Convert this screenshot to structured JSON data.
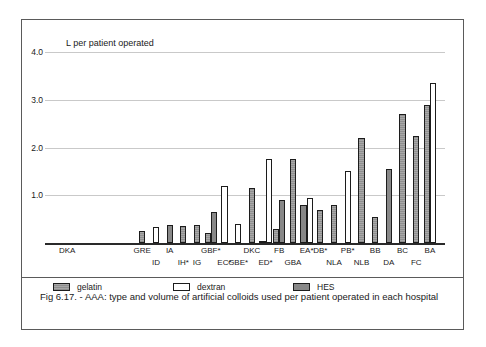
{
  "figure": {
    "caption": "Fig 6.17. - AAA: type and volume of artificial colloids used per patient operated in each hospital",
    "empty_group_label": "DKA"
  },
  "legend": {
    "items": [
      {
        "label": "gelatin",
        "key": "gelatin",
        "color": "#a8a8a8"
      },
      {
        "label": "dextran",
        "key": "dextran",
        "color": "#ffffff"
      },
      {
        "label": "HES",
        "key": "hes",
        "color": "#888888"
      }
    ]
  },
  "chart_data": {
    "type": "bar",
    "title": "",
    "subtitle": "",
    "ylabel": "L  per patient operated",
    "xlabel": "",
    "ylim": [
      0,
      4.0
    ],
    "yticks": [
      "1.0",
      "2.0",
      "3.0",
      "4.0"
    ],
    "ytick_values": [
      1.0,
      2.0,
      3.0,
      4.0
    ],
    "grid": true,
    "legend_position": "below-axis",
    "categories": [
      "GRE",
      "ID",
      "IA",
      "IH*",
      "IG",
      "GBF*",
      "EC*",
      "GBE*",
      "DKC",
      "ED*",
      "FB",
      "GBA",
      "EA*",
      "DB*",
      "NLA",
      "PB*",
      "NLB",
      "BB",
      "DA",
      "BC",
      "FC",
      "BA"
    ],
    "series": [
      {
        "name": "gelatin",
        "values": [
          0.25,
          0.0,
          0.0,
          0.35,
          0.38,
          0.2,
          0.0,
          0.0,
          1.15,
          0.05,
          0.3,
          1.75,
          0.0,
          0.7,
          0.8,
          0.0,
          2.2,
          0.55,
          0.0,
          2.7,
          2.25,
          2.9
        ]
      },
      {
        "name": "dextran",
        "values": [
          0.0,
          0.33,
          0.0,
          0.0,
          0.0,
          0.0,
          1.2,
          0.4,
          0.0,
          1.75,
          0.0,
          0.0,
          0.95,
          0.0,
          0.0,
          1.5,
          0.0,
          0.0,
          0.0,
          0.0,
          0.0,
          3.35
        ]
      },
      {
        "name": "HES",
        "values": [
          0.0,
          0.0,
          0.37,
          0.0,
          0.0,
          0.65,
          0.0,
          0.0,
          0.0,
          0.0,
          0.9,
          0.0,
          0.8,
          0.0,
          0.0,
          0.0,
          0.0,
          0.0,
          1.55,
          0.0,
          0.0,
          0.0
        ]
      }
    ],
    "bars": [
      {
        "category": "GRE",
        "series": "gelatin",
        "value": 0.25
      },
      {
        "category": "ID",
        "series": "dextran",
        "value": 0.33
      },
      {
        "category": "IA",
        "series": "HES",
        "value": 0.37
      },
      {
        "category": "IH*",
        "series": "gelatin",
        "value": 0.35
      },
      {
        "category": "IG",
        "series": "gelatin",
        "value": 0.38
      },
      {
        "category": "GBF*",
        "series": "gelatin",
        "value": 0.2
      },
      {
        "category": "GBF*",
        "series": "HES",
        "value": 0.65
      },
      {
        "category": "EC*",
        "series": "dextran",
        "value": 1.2
      },
      {
        "category": "DKC",
        "series": "gelatin",
        "value": 1.15
      },
      {
        "category": "GBE*",
        "series": "dextran",
        "value": 0.4
      },
      {
        "category": "ED*",
        "series": "gelatin",
        "value": 0.05
      },
      {
        "category": "ED*",
        "series": "dextran",
        "value": 1.75
      },
      {
        "category": "FB",
        "series": "gelatin",
        "value": 0.3
      },
      {
        "category": "FB",
        "series": "HES",
        "value": 0.9
      },
      {
        "category": "GBA",
        "series": "gelatin",
        "value": 1.75
      },
      {
        "category": "EA*",
        "series": "HES",
        "value": 0.8
      },
      {
        "category": "EA*",
        "series": "dextran",
        "value": 0.95
      },
      {
        "category": "DB*",
        "series": "gelatin",
        "value": 0.7
      },
      {
        "category": "NLA",
        "series": "gelatin",
        "value": 0.8
      },
      {
        "category": "PB*",
        "series": "dextran",
        "value": 1.5
      },
      {
        "category": "NLB",
        "series": "gelatin",
        "value": 2.2
      },
      {
        "category": "BB",
        "series": "gelatin",
        "value": 0.55
      },
      {
        "category": "DA",
        "series": "HES",
        "value": 1.55
      },
      {
        "category": "BC",
        "series": "gelatin",
        "value": 2.7
      },
      {
        "category": "FC",
        "series": "gelatin",
        "value": 2.25
      },
      {
        "category": "BA",
        "series": "gelatin",
        "value": 2.9
      },
      {
        "category": "BA",
        "series": "dextran",
        "value": 3.35
      }
    ],
    "xtick_rows": [
      {
        "row": 0,
        "labels": [
          "GRE",
          "IA",
          "GBF*",
          "DKC",
          "FB",
          "EA*",
          "DB*",
          "PB*",
          "BB",
          "BC",
          "BA"
        ]
      },
      {
        "row": 1,
        "labels": [
          "ID",
          "IH*",
          "IG",
          "EC*",
          "GBE*",
          "ED*",
          "GBA",
          "NLA",
          "NLB",
          "DA",
          "FC"
        ]
      }
    ]
  }
}
